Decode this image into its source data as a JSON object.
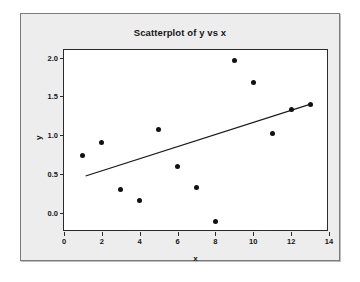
{
  "chart_data": {
    "type": "scatter",
    "title": "Scatterplot of y vs x",
    "xlabel": "x",
    "ylabel": "y",
    "xlim": [
      0,
      14
    ],
    "ylim": [
      -0.25,
      2.1
    ],
    "xticks": [
      "0",
      "2",
      "4",
      "6",
      "8",
      "10",
      "12",
      "14"
    ],
    "xtick_values": [
      0,
      2,
      4,
      6,
      8,
      10,
      12,
      14
    ],
    "yticks": [
      "0.0",
      "0.5",
      "1.0",
      "1.5",
      "2.0"
    ],
    "ytick_values": [
      0.0,
      0.5,
      1.0,
      1.5,
      2.0
    ],
    "grid": false,
    "legend": null,
    "x": [
      1,
      2,
      3,
      4,
      5,
      6,
      7,
      8,
      9,
      10,
      11,
      12,
      13
    ],
    "y": [
      0.74,
      0.91,
      0.3,
      0.16,
      1.07,
      0.6,
      0.33,
      -0.12,
      1.96,
      1.68,
      1.02,
      1.33,
      1.39
    ],
    "points": [
      {
        "x": 1,
        "y": 0.74
      },
      {
        "x": 2,
        "y": 0.91
      },
      {
        "x": 3,
        "y": 0.3
      },
      {
        "x": 4,
        "y": 0.16
      },
      {
        "x": 5,
        "y": 1.07
      },
      {
        "x": 6,
        "y": 0.6
      },
      {
        "x": 7,
        "y": 0.33
      },
      {
        "x": 8,
        "y": -0.12
      },
      {
        "x": 9,
        "y": 1.96
      },
      {
        "x": 10,
        "y": 1.68
      },
      {
        "x": 11,
        "y": 1.02
      },
      {
        "x": 12,
        "y": 1.33
      },
      {
        "x": 13,
        "y": 1.39
      }
    ],
    "fit_line": {
      "type": "linear-regression",
      "x_start": 1.15,
      "y_start": 0.455,
      "x_end": 13.0,
      "y_end": 1.385,
      "color": "#1a1a1a"
    },
    "marker": {
      "shape": "filled-circle",
      "color": "#111111",
      "size_px": 5
    },
    "colors": {
      "plot_background": "#ffffff",
      "panel_background": "#ededed",
      "axis": "#2b2b2b",
      "text": "#161616",
      "panel_border": "#7b7b7b"
    }
  }
}
